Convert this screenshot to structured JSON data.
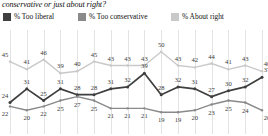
{
  "question": "conservative or just about right?",
  "legend": {
    "items": [
      {
        "label": "% Too liberal",
        "color": "#3f3f3f"
      },
      {
        "label": "% Too conservative",
        "color": "#8a8a8a"
      },
      {
        "label": "% About right",
        "color": "#c9c9c9"
      }
    ]
  },
  "chart_data": {
    "type": "line",
    "title": "conservative or just about right?",
    "xlabel": "",
    "ylabel": "",
    "ylim": [
      14,
      54
    ],
    "grid": true,
    "legend_position": "top",
    "x": [
      1,
      2,
      3,
      4,
      5,
      6,
      7,
      8,
      9,
      10,
      11,
      12,
      13,
      14,
      15,
      16
    ],
    "categories": [
      "1",
      "2",
      "3",
      "4",
      "5",
      "6",
      "7",
      "8",
      "9",
      "10",
      "11",
      "12",
      "13",
      "14",
      "15",
      "16"
    ],
    "series": [
      {
        "name": "% About right",
        "color": "#c9c9c9",
        "values": [
          45,
          41,
          46,
          39,
          40,
          45,
          43,
          43,
          43,
          50,
          43,
          42,
          44,
          41,
          43,
          40
        ]
      },
      {
        "name": "% Too liberal",
        "color": "#3f3f3f",
        "values": [
          24,
          31,
          25,
          31,
          28,
          28,
          31,
          32,
          39,
          28,
          32,
          31,
          27,
          30,
          32,
          37
        ]
      },
      {
        "name": "% Too conservative",
        "color": "#8a8a8a",
        "values": [
          22,
          20,
          22,
          25,
          27,
          25,
          21,
          21,
          21,
          19,
          19,
          20,
          23,
          25,
          24,
          20
        ]
      }
    ]
  }
}
